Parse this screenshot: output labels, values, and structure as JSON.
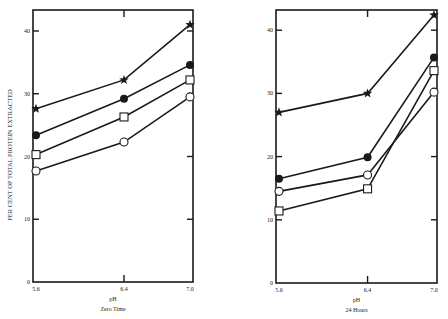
{
  "figure": {
    "ylabel": "PER CENT OF TOTAL PROTEIN EXTRACTED",
    "ink_color": "#1a1a1a",
    "background": "#ffffff"
  },
  "chart_data": [
    {
      "type": "line",
      "title": "Zero Time",
      "xlabel": "pH",
      "ylabel": "PER CENT OF TOTAL PROTEIN EXTRACTED",
      "x": [
        5.6,
        6.4,
        7.0
      ],
      "x_tick_labels": [
        "5.6",
        "6.4",
        "7.0"
      ],
      "ylim": [
        0,
        43
      ],
      "y_ticks": [
        0,
        10,
        20,
        30,
        40
      ],
      "grid": false,
      "legend": "none",
      "series": [
        {
          "name": "star",
          "marker": "star",
          "values": [
            27.6,
            32.2,
            41.0
          ]
        },
        {
          "name": "filled circle",
          "marker": "filled-circle",
          "values": [
            23.4,
            29.2,
            34.6
          ]
        },
        {
          "name": "open square",
          "marker": "open-square",
          "values": [
            20.3,
            26.3,
            32.2
          ]
        },
        {
          "name": "open circle",
          "marker": "open-circle",
          "values": [
            17.7,
            22.3,
            29.5
          ]
        }
      ]
    },
    {
      "type": "line",
      "title": "24 Hours",
      "xlabel": "pH",
      "ylabel": "",
      "x": [
        5.6,
        6.4,
        7.0
      ],
      "x_tick_labels": [
        "5.6",
        "6.4",
        "7.0"
      ],
      "ylim": [
        0,
        43
      ],
      "y_ticks": [
        0,
        10,
        20,
        30,
        40
      ],
      "grid": false,
      "legend": "none",
      "series": [
        {
          "name": "star",
          "marker": "star",
          "values": [
            27.0,
            30.0,
            42.4
          ]
        },
        {
          "name": "filled circle",
          "marker": "filled-circle",
          "values": [
            16.5,
            19.9,
            35.7
          ]
        },
        {
          "name": "open circle",
          "marker": "open-circle",
          "values": [
            14.5,
            17.1,
            30.2
          ]
        },
        {
          "name": "open square",
          "marker": "open-square",
          "values": [
            11.4,
            14.9,
            33.6
          ]
        }
      ]
    }
  ]
}
